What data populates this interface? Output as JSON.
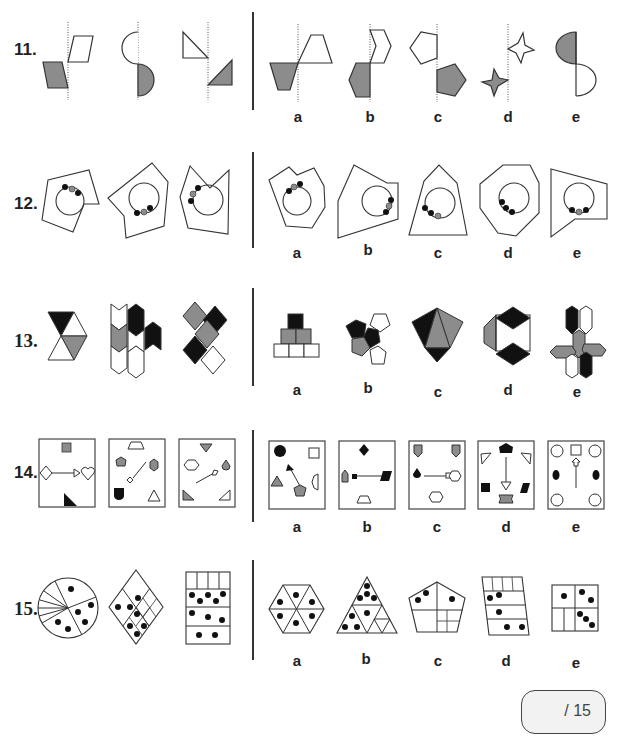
{
  "colors": {
    "gray": "#8c8c8c",
    "black": "#111111",
    "line": "#333333",
    "white": "#ffffff"
  },
  "questions": [
    {
      "number": "11.",
      "prompt_figures": [
        "parallelogram-mirror-pair",
        "semicircle-mirror-pair",
        "right-triangle-mirror-pair"
      ],
      "options": [
        {
          "label": "a",
          "description": "trapezoid mirror pair"
        },
        {
          "label": "b",
          "description": "hexagon mirror pair"
        },
        {
          "label": "c",
          "description": "pentagon mirror pair"
        },
        {
          "label": "d",
          "description": "four-point star mirror pair"
        },
        {
          "label": "e",
          "description": "half-ellipse mirror pair"
        }
      ]
    },
    {
      "number": "12.",
      "prompt_figures": [
        "polygon-circle-dots-1",
        "polygon-circle-dots-2",
        "polygon-circle-dots-3"
      ],
      "options": [
        {
          "label": "a",
          "description": "polygon with circle, black-gray-black dots"
        },
        {
          "label": "b",
          "description": "polygon with circle, black-gray-black dots right"
        },
        {
          "label": "c",
          "description": "pentagon with circle, black-black-gray dots"
        },
        {
          "label": "d",
          "description": "octagon with circle, three black dots"
        },
        {
          "label": "e",
          "description": "quadrilateral with circle, black-gray-black dots bottom"
        }
      ]
    },
    {
      "number": "13.",
      "prompt_figures": [
        "triangle-hexagon",
        "chevron-stacks",
        "diamond-cross"
      ],
      "options": [
        {
          "label": "a",
          "description": "square pyramid"
        },
        {
          "label": "b",
          "description": "pentagon cluster"
        },
        {
          "label": "c",
          "description": "triangle kite"
        },
        {
          "label": "d",
          "description": "hexagon with rhombi"
        },
        {
          "label": "e",
          "description": "hexagon pinwheel"
        }
      ]
    },
    {
      "number": "14.",
      "prompt_figures": [
        "box-arrow-right",
        "box-arrow-diagonal-down",
        "box-arrow-diagonal-up"
      ],
      "options": [
        {
          "label": "a",
          "description": "box with arrow up-left"
        },
        {
          "label": "b",
          "description": "box with horizontal arrow"
        },
        {
          "label": "c",
          "description": "box with horizontal arrow right"
        },
        {
          "label": "d",
          "description": "box with arrow down"
        },
        {
          "label": "e",
          "description": "box with arrow up"
        }
      ]
    },
    {
      "number": "15.",
      "prompt_figures": [
        "circle-dots",
        "rhombus-dots",
        "rectangle-dots"
      ],
      "options": [
        {
          "label": "a",
          "description": "hexagon with dots"
        },
        {
          "label": "b",
          "description": "triangle with dots"
        },
        {
          "label": "c",
          "description": "pentagon with dots"
        },
        {
          "label": "d",
          "description": "parallelogram with dots"
        },
        {
          "label": "e",
          "description": "square with dots"
        }
      ]
    }
  ],
  "score_box": {
    "text": "/ 15"
  }
}
